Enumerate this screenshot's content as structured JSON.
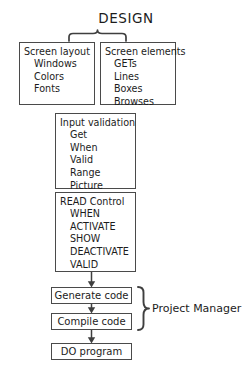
{
  "diagram": {
    "title": "DESIGN",
    "type": "flowchart",
    "boxes": [
      {
        "id": "screen-layout",
        "title": "Screen layout",
        "items": [
          "Windows",
          "Colors",
          "Fonts"
        ]
      },
      {
        "id": "screen-elements",
        "title": "Screen elements",
        "items": [
          "GETs",
          "Lines",
          "Boxes",
          "Browses"
        ]
      },
      {
        "id": "input-validation",
        "title": "Input validation",
        "items": [
          "Get",
          "When",
          "Valid",
          "Range",
          "Picture"
        ]
      },
      {
        "id": "read-control",
        "title": "READ Control",
        "items": [
          "WHEN",
          "ACTIVATE",
          "SHOW",
          "DEACTIVATE",
          "VALID"
        ]
      }
    ],
    "steps": [
      {
        "id": "generate-code",
        "label": "Generate code"
      },
      {
        "id": "compile-code",
        "label": "Compile code"
      },
      {
        "id": "do-program",
        "label": "DO program"
      }
    ],
    "annotations": {
      "project_manager": "Project Manager"
    },
    "colors": {
      "stroke": "#4a4a4a",
      "text": "#1c1c1c",
      "background": "#ffffff"
    }
  }
}
